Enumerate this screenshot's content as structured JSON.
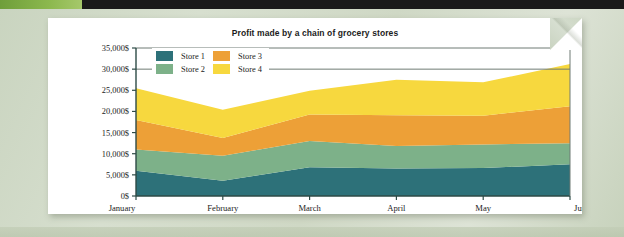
{
  "page": {
    "background_color": "#cfd9c6",
    "sheet_color": "#ffffff",
    "topbar_color": "#1a1a1a",
    "topbar_accent_color": "#8cb84e"
  },
  "legend": {
    "position": "top-left-inside-plot",
    "entries": [
      {
        "label": "Store 1",
        "color": "#2d7179"
      },
      {
        "label": "Store 3",
        "color": "#eda037"
      },
      {
        "label": "Store 2",
        "color": "#7db189"
      },
      {
        "label": "Store 4",
        "color": "#f7d83e"
      }
    ]
  },
  "chart_data": {
    "type": "area",
    "stacked": true,
    "title": "Profit made by a chain of grocery stores",
    "xlabel": "",
    "ylabel": "",
    "categories": [
      "January",
      "February",
      "March",
      "April",
      "May",
      "June"
    ],
    "ylim": [
      0,
      35000
    ],
    "ytick_values": [
      0,
      5000,
      10000,
      15000,
      20000,
      25000,
      30000,
      35000
    ],
    "ytick_labels": [
      "0$",
      "5,000$",
      "10,000$",
      "15,000$",
      "20,000$",
      "25,000$",
      "30,000$",
      "35,000$"
    ],
    "grid": false,
    "gridlines_drawn_at": [
      30000,
      35000
    ],
    "series": [
      {
        "name": "Store 1",
        "color": "#2d7179",
        "values": [
          6000,
          3600,
          6800,
          6500,
          6600,
          7500
        ]
      },
      {
        "name": "Store 2",
        "color": "#7db189",
        "values": [
          5000,
          5900,
          6200,
          5300,
          5600,
          5000
        ]
      },
      {
        "name": "Store 3",
        "color": "#eda037",
        "values": [
          7000,
          4200,
          6300,
          7300,
          6800,
          8700
        ]
      },
      {
        "name": "Store 4",
        "color": "#f7d83e",
        "values": [
          7500,
          6700,
          5600,
          8400,
          7900,
          10000
        ]
      }
    ],
    "cumulative_tops": {
      "Store 1": [
        6000,
        3600,
        6800,
        6500,
        6600,
        7500
      ],
      "Store 2": [
        11000,
        9500,
        13000,
        11800,
        12200,
        12500
      ],
      "Store 3": [
        18000,
        13700,
        19300,
        19100,
        19000,
        21200
      ],
      "Store 4": [
        25500,
        20400,
        24900,
        27500,
        26900,
        31200
      ]
    }
  }
}
